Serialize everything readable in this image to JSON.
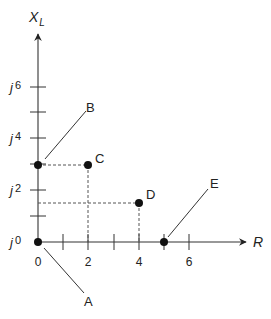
{
  "diagram": {
    "y_axis_label": "X",
    "y_axis_label_subscript": "L",
    "x_axis_label": "R",
    "y_tick_labels": [
      {
        "prefix": "j",
        "value": "0"
      },
      {
        "prefix": "j",
        "value": "2"
      },
      {
        "prefix": "j",
        "value": "4"
      },
      {
        "prefix": "j",
        "value": "6"
      }
    ],
    "x_tick_labels": [
      "0",
      "2",
      "4",
      "6"
    ],
    "points": [
      {
        "label": "A",
        "R": 0,
        "XL": 0
      },
      {
        "label": "B",
        "R": 0,
        "XL": 3
      },
      {
        "label": "C",
        "R": 2,
        "XL": 3
      },
      {
        "label": "D",
        "R": 4,
        "XL": 1.5
      },
      {
        "label": "E",
        "R": 5,
        "XL": 0
      }
    ],
    "colors": {
      "line": "#333333",
      "dot": "#111111",
      "dash": "#555555"
    }
  }
}
